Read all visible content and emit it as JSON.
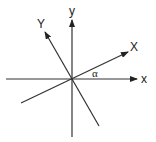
{
  "diagram": {
    "type": "coordinate-rotation",
    "origin": {
      "x": 72,
      "y": 79
    },
    "line_color": "#333333",
    "axes": [
      {
        "id": "x",
        "label": "x",
        "from": [
          6,
          79
        ],
        "to": [
          137,
          79
        ],
        "label_pos": [
          144,
          83
        ],
        "arrow": true
      },
      {
        "id": "y",
        "label": "y",
        "from": [
          72,
          137
        ],
        "to": [
          72,
          20
        ],
        "label_pos": [
          72,
          15
        ],
        "arrow": true
      },
      {
        "id": "X",
        "label": "X",
        "from": [
          21,
          103
        ],
        "to": [
          128,
          52
        ],
        "label_pos": [
          134,
          51
        ],
        "arrow": true
      },
      {
        "id": "Y",
        "label": "Y",
        "from": [
          99,
          126
        ],
        "to": [
          45,
          32
        ],
        "label_pos": [
          41,
          28
        ],
        "arrow": true
      }
    ],
    "angle": {
      "label": "α",
      "label_pos": [
        95,
        77
      ]
    }
  }
}
